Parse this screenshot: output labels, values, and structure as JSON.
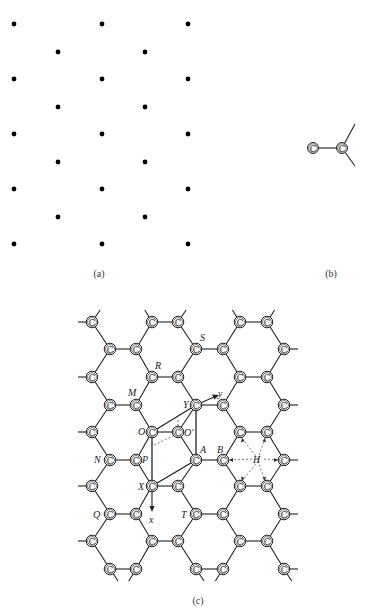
{
  "figure": {
    "panels": [
      {
        "id": "a",
        "caption": "(a)",
        "description": "2D hexagonal point lattice"
      },
      {
        "id": "b",
        "caption": "(b)",
        "description": "carbon basis with three bonds"
      },
      {
        "id": "c",
        "caption": "(c)",
        "description": "graphene honeycomb lattice with unit cell and labels"
      }
    ],
    "atom_symbol": "C",
    "panel_a": {
      "columns_x": [
        14,
        58,
        102,
        145,
        188
      ],
      "rows_y_even_cols": [
        24,
        79,
        134,
        189,
        244
      ],
      "rows_y_odd_cols": [
        52,
        107,
        162,
        217
      ]
    },
    "panel_c": {
      "point_labels": {
        "S": "S",
        "R": "R",
        "M": "M",
        "Y": "Y",
        "y_axis": "y",
        "O": "O",
        "O_prime": "O′",
        "N": "N",
        "P": "P",
        "A": "A",
        "B": "B",
        "H": "H",
        "X": "X",
        "x_axis": "x",
        "Q": "Q",
        "T": "T"
      },
      "row_type1_x": [
        92,
        152,
        178,
        240,
        267
      ],
      "row_type2_x": [
        110,
        136,
        196,
        223,
        284
      ],
      "row_type1_y": [
        322,
        377,
        432,
        486,
        541
      ],
      "row_type2_y": [
        349,
        405,
        460,
        514,
        569
      ]
    }
  }
}
